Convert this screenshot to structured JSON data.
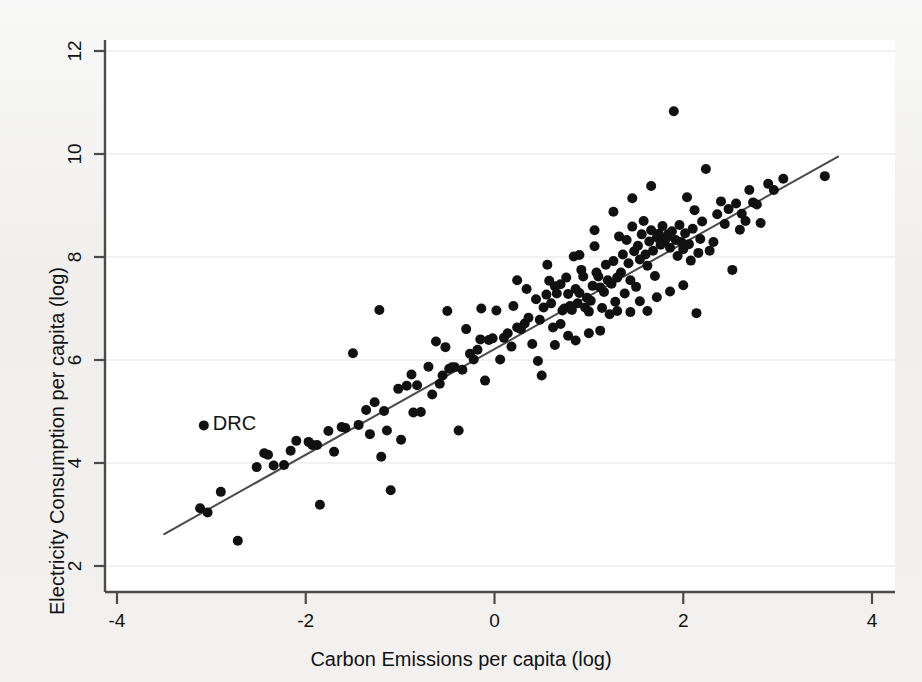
{
  "figure": {
    "background_color": "#f1f0ef",
    "plot_background_color": "#ffffff",
    "marker_color": "#111111",
    "line_color": "#4a4a4a",
    "grid_color": "#e6e6e4",
    "axis_color": "#4b4b4b"
  },
  "annotations": [
    {
      "label": "DRC",
      "x": -3.08,
      "y": 4.73,
      "marker": true
    }
  ],
  "chart_data": {
    "type": "scatter",
    "title": "",
    "xlabel": "Carbon Emissions per capita (log)",
    "ylabel": "Electricity Consumption per capita (log)",
    "xlim": [
      -4.0,
      4.0
    ],
    "ylim": [
      2.0,
      12.0
    ],
    "xticks": [
      -4,
      -2,
      0,
      2,
      4
    ],
    "yticks": [
      2,
      4,
      6,
      8,
      10,
      12
    ],
    "xtick_labels": [
      "-4",
      "-2",
      "0",
      "2",
      "4"
    ],
    "ytick_labels": [
      "2",
      "4",
      "6",
      "8",
      "10",
      "12"
    ],
    "grid": true,
    "grid_axis": "y",
    "legend": false,
    "marker_size": 10,
    "fit_line": {
      "label": "linear fit",
      "x_start": -3.5,
      "y_start": 2.62,
      "x_end": 3.64,
      "y_end": 9.95
    },
    "points": [
      [
        -3.12,
        3.12
      ],
      [
        -3.04,
        3.04
      ],
      [
        -2.9,
        3.44
      ],
      [
        -2.72,
        2.49
      ],
      [
        -2.52,
        3.92
      ],
      [
        -2.44,
        4.19
      ],
      [
        -2.4,
        4.16
      ],
      [
        -2.23,
        3.96
      ],
      [
        -2.16,
        4.24
      ],
      [
        -2.1,
        4.43
      ],
      [
        -1.97,
        4.41
      ],
      [
        -1.93,
        4.35
      ],
      [
        -1.88,
        4.35
      ],
      [
        -1.85,
        3.19
      ],
      [
        -1.76,
        4.62
      ],
      [
        -1.62,
        4.7
      ],
      [
        -1.58,
        4.68
      ],
      [
        -1.5,
        6.13
      ],
      [
        -1.44,
        4.74
      ],
      [
        -1.36,
        5.03
      ],
      [
        -1.27,
        5.18
      ],
      [
        -1.22,
        6.97
      ],
      [
        -1.2,
        4.12
      ],
      [
        -1.17,
        5.01
      ],
      [
        -1.14,
        4.63
      ],
      [
        -1.1,
        3.47
      ],
      [
        -1.02,
        5.44
      ],
      [
        -0.99,
        4.45
      ],
      [
        -0.93,
        5.5
      ],
      [
        -0.88,
        5.72
      ],
      [
        -0.82,
        5.51
      ],
      [
        -0.78,
        4.99
      ],
      [
        -0.7,
        5.87
      ],
      [
        -0.66,
        5.33
      ],
      [
        -0.62,
        6.36
      ],
      [
        -0.58,
        5.54
      ],
      [
        -0.55,
        5.7
      ],
      [
        -0.52,
        6.25
      ],
      [
        -0.48,
        5.83
      ],
      [
        -0.45,
        5.86
      ],
      [
        -0.42,
        5.86
      ],
      [
        -0.38,
        4.63
      ],
      [
        -0.34,
        5.81
      ],
      [
        -0.3,
        6.6
      ],
      [
        -0.26,
        6.12
      ],
      [
        -0.22,
        6.01
      ],
      [
        -0.18,
        6.2
      ],
      [
        -0.15,
        6.4
      ],
      [
        -0.1,
        5.6
      ],
      [
        -0.06,
        6.39
      ],
      [
        -0.02,
        6.42
      ],
      [
        0.02,
        6.96
      ],
      [
        0.06,
        6.01
      ],
      [
        0.1,
        6.43
      ],
      [
        0.14,
        6.52
      ],
      [
        0.18,
        6.26
      ],
      [
        0.2,
        7.05
      ],
      [
        0.24,
        6.63
      ],
      [
        0.28,
        6.6
      ],
      [
        0.32,
        6.71
      ],
      [
        0.36,
        6.82
      ],
      [
        0.4,
        6.31
      ],
      [
        0.44,
        7.18
      ],
      [
        0.48,
        6.78
      ],
      [
        0.52,
        7.02
      ],
      [
        0.55,
        7.27
      ],
      [
        0.58,
        7.54
      ],
      [
        0.6,
        7.1
      ],
      [
        0.62,
        6.63
      ],
      [
        0.64,
        7.43
      ],
      [
        0.66,
        7.29
      ],
      [
        0.7,
        7.47
      ],
      [
        0.72,
        6.96
      ],
      [
        0.74,
        7.0
      ],
      [
        0.76,
        7.6
      ],
      [
        0.78,
        7.28
      ],
      [
        0.8,
        7.05
      ],
      [
        0.82,
        6.97
      ],
      [
        0.84,
        8.01
      ],
      [
        0.86,
        7.38
      ],
      [
        0.88,
        7.1
      ],
      [
        0.9,
        7.3
      ],
      [
        0.92,
        7.75
      ],
      [
        0.94,
        7.62
      ],
      [
        0.96,
        7.02
      ],
      [
        0.98,
        7.21
      ],
      [
        1.0,
        6.52
      ],
      [
        1.02,
        7.15
      ],
      [
        1.04,
        7.44
      ],
      [
        1.06,
        8.21
      ],
      [
        1.08,
        7.7
      ],
      [
        1.1,
        7.62
      ],
      [
        1.12,
        7.41
      ],
      [
        1.14,
        7.01
      ],
      [
        1.16,
        7.32
      ],
      [
        1.18,
        7.85
      ],
      [
        1.2,
        7.55
      ],
      [
        1.22,
        6.89
      ],
      [
        1.24,
        7.48
      ],
      [
        1.26,
        7.92
      ],
      [
        1.28,
        7.13
      ],
      [
        1.3,
        7.6
      ],
      [
        1.32,
        8.4
      ],
      [
        1.34,
        7.7
      ],
      [
        1.36,
        8.05
      ],
      [
        1.38,
        7.29
      ],
      [
        1.4,
        8.33
      ],
      [
        1.42,
        7.88
      ],
      [
        1.44,
        7.55
      ],
      [
        1.46,
        8.59
      ],
      [
        1.48,
        8.11
      ],
      [
        1.5,
        7.42
      ],
      [
        1.52,
        8.22
      ],
      [
        1.54,
        7.95
      ],
      [
        1.56,
        8.44
      ],
      [
        1.58,
        8.7
      ],
      [
        1.6,
        8.05
      ],
      [
        1.62,
        7.83
      ],
      [
        1.64,
        8.3
      ],
      [
        1.66,
        8.52
      ],
      [
        1.68,
        8.12
      ],
      [
        1.7,
        7.63
      ],
      [
        1.72,
        8.38
      ],
      [
        1.74,
        8.45
      ],
      [
        1.76,
        8.24
      ],
      [
        1.78,
        8.6
      ],
      [
        1.8,
        8.29
      ],
      [
        1.82,
        8.36
      ],
      [
        1.84,
        8.44
      ],
      [
        1.86,
        8.18
      ],
      [
        1.88,
        8.5
      ],
      [
        1.9,
        10.83
      ],
      [
        1.92,
        8.33
      ],
      [
        1.94,
        8.02
      ],
      [
        1.96,
        8.62
      ],
      [
        1.98,
        8.29
      ],
      [
        2.0,
        8.15
      ],
      [
        2.02,
        8.46
      ],
      [
        2.04,
        9.16
      ],
      [
        2.06,
        8.25
      ],
      [
        2.08,
        7.93
      ],
      [
        2.1,
        8.55
      ],
      [
        2.12,
        8.91
      ],
      [
        2.14,
        6.91
      ],
      [
        2.16,
        8.08
      ],
      [
        2.18,
        8.35
      ],
      [
        2.2,
        8.69
      ],
      [
        2.24,
        9.71
      ],
      [
        2.28,
        8.12
      ],
      [
        2.32,
        8.29
      ],
      [
        2.36,
        8.83
      ],
      [
        2.4,
        9.08
      ],
      [
        2.44,
        8.64
      ],
      [
        2.48,
        8.93
      ],
      [
        2.52,
        7.75
      ],
      [
        2.56,
        9.04
      ],
      [
        2.6,
        8.53
      ],
      [
        2.62,
        8.84
      ],
      [
        2.66,
        8.7
      ],
      [
        2.7,
        9.3
      ],
      [
        2.74,
        9.06
      ],
      [
        2.78,
        9.02
      ],
      [
        2.82,
        8.66
      ],
      [
        2.9,
        9.42
      ],
      [
        2.96,
        9.3
      ],
      [
        3.06,
        9.52
      ],
      [
        3.5,
        9.57
      ],
      [
        0.46,
        5.98
      ],
      [
        0.5,
        5.7
      ],
      [
        0.64,
        6.29
      ],
      [
        0.7,
        6.7
      ],
      [
        0.78,
        6.47
      ],
      [
        0.86,
        6.38
      ],
      [
        1.0,
        6.94
      ],
      [
        1.12,
        6.57
      ],
      [
        1.3,
        6.95
      ],
      [
        1.44,
        6.93
      ],
      [
        1.54,
        7.14
      ],
      [
        1.62,
        6.95
      ],
      [
        1.72,
        7.22
      ],
      [
        1.86,
        7.33
      ],
      [
        2.0,
        7.45
      ],
      [
        0.34,
        7.38
      ],
      [
        0.56,
        7.85
      ],
      [
        0.9,
        8.04
      ],
      [
        1.06,
        8.52
      ],
      [
        1.26,
        8.88
      ],
      [
        1.46,
        9.14
      ],
      [
        1.66,
        9.38
      ],
      [
        -0.5,
        6.95
      ],
      [
        -0.14,
        7.0
      ],
      [
        0.24,
        7.55
      ],
      [
        -2.34,
        3.95
      ],
      [
        -1.7,
        4.22
      ],
      [
        -1.32,
        4.56
      ],
      [
        -0.86,
        4.98
      ]
    ]
  }
}
